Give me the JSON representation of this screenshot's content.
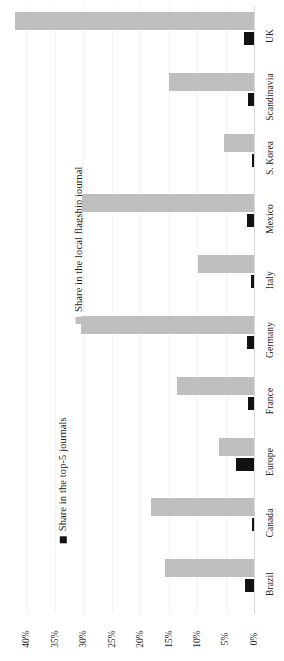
{
  "chart_data": {
    "type": "bar",
    "orientation": "horizontal",
    "title": "",
    "subtitle": "",
    "xlabel": "",
    "ylabel": "",
    "xlim": [
      0,
      40
    ],
    "xtick_labels": [
      "0%",
      "5%",
      "10%",
      "15%",
      "20%",
      "25%",
      "30%",
      "35%",
      "40%"
    ],
    "xticks": [
      0,
      5,
      10,
      15,
      20,
      25,
      30,
      35,
      40
    ],
    "grid": true,
    "legend_position": "left-outside",
    "value_suffix": "%",
    "categories": [
      "UK",
      "Scandinavia",
      "S. Korea",
      "Mexico",
      "Italy",
      "Germany",
      "France",
      "Europe",
      "Canada",
      "Brazil"
    ],
    "series": [
      {
        "name": "Share in the local flagship journal",
        "color": "#bfbfbf",
        "marker": "square",
        "values": [
          42.0,
          15.0,
          5.3,
          30.2,
          9.9,
          30.4,
          13.5,
          6.2,
          18.0,
          15.6
        ]
      },
      {
        "name": "Share in the top-5 journals",
        "color": "#121212",
        "marker": "square",
        "values": [
          1.7,
          1.1,
          0.3,
          1.2,
          0.5,
          1.3,
          1.0,
          3.2,
          0.4,
          1.6
        ]
      }
    ]
  },
  "legend": {
    "entries": [
      {
        "label": "Share in the top-5 journals",
        "color": "#121212"
      },
      {
        "label": "Share in the local flagship journal",
        "color": "#bfbfbf"
      }
    ]
  },
  "axis": {
    "ticks": [
      "40%",
      "35%",
      "30%",
      "25%",
      "20%",
      "15%",
      "10%",
      "5%",
      "0%"
    ]
  },
  "categories": {
    "labels": [
      "UK",
      "Scandinavia",
      "S. Korea",
      "Mexico",
      "Italy",
      "Germany",
      "France",
      "Europe",
      "Canada",
      "Brazil"
    ]
  }
}
